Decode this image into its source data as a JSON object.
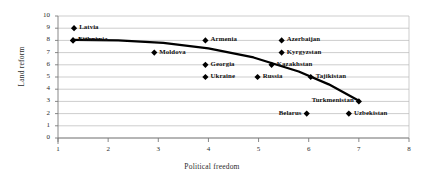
{
  "chart_data": {
    "type": "scatter",
    "title": "",
    "xlabel": "Political freedom",
    "ylabel": "Land reform",
    "xlim": [
      1,
      8
    ],
    "ylim": [
      0,
      10
    ],
    "xticks": [
      1,
      2,
      3,
      4,
      5,
      6,
      7,
      8
    ],
    "yticks": [
      0,
      1,
      2,
      3,
      4,
      5,
      6,
      7,
      8,
      9,
      10
    ],
    "grid": "horizontal",
    "legend": "none",
    "marker": "filled-diamond",
    "points": [
      {
        "label": "Latvia",
        "x": 1.32,
        "y": 9.0,
        "label_side": "right"
      },
      {
        "label": "Lithuania",
        "x": 1.3,
        "y": 8.0,
        "label_side": "right"
      },
      {
        "label": "Estonia",
        "x": 1.3,
        "y": 8.0,
        "label_side": "right"
      },
      {
        "label": "Moldova",
        "x": 2.92,
        "y": 7.0,
        "label_side": "right"
      },
      {
        "label": "Armenia",
        "x": 3.94,
        "y": 8.0,
        "label_side": "right"
      },
      {
        "label": "Georgia",
        "x": 3.94,
        "y": 6.0,
        "label_side": "right"
      },
      {
        "label": "Ukraine",
        "x": 3.94,
        "y": 5.0,
        "label_side": "right"
      },
      {
        "label": "Azerbaijan",
        "x": 5.46,
        "y": 8.0,
        "label_side": "right"
      },
      {
        "label": "Kyrgyzstan",
        "x": 5.46,
        "y": 7.0,
        "label_side": "right"
      },
      {
        "label": "Kazakhstan",
        "x": 5.26,
        "y": 6.0,
        "label_side": "right"
      },
      {
        "label": "Russia",
        "x": 4.98,
        "y": 5.0,
        "label_side": "right"
      },
      {
        "label": "Tajikistan",
        "x": 6.04,
        "y": 5.0,
        "label_side": "right"
      },
      {
        "label": "Turkmenistan",
        "x": 7.0,
        "y": 3.0,
        "label_side": "left"
      },
      {
        "label": "Uzbekistan",
        "x": 6.8,
        "y": 2.0,
        "label_side": "right"
      },
      {
        "label": "Belarus",
        "x": 5.96,
        "y": 2.0,
        "label_side": "left"
      }
    ],
    "trend_line": {
      "name": "fitted trend",
      "x": [
        1.3,
        2.2,
        3.1,
        4.0,
        4.9,
        5.8,
        6.4,
        7.0
      ],
      "y": [
        8.05,
        8.0,
        7.8,
        7.35,
        6.6,
        5.45,
        4.4,
        3.05
      ]
    },
    "colors": {
      "marker": "#000000",
      "trend_line": "#000000",
      "grid": "#b7b7b7",
      "axis": "#7a7a7a",
      "text": "#1a1a1a"
    }
  }
}
